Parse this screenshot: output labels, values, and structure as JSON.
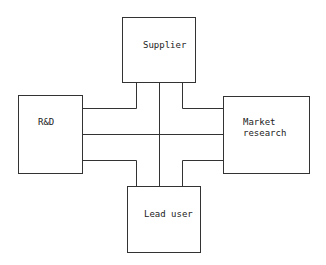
{
  "diagram": {
    "type": "block-diagram",
    "nodes": [
      {
        "id": "supplier",
        "label": "Supplier",
        "position": "top"
      },
      {
        "id": "rnd",
        "label": "R&D",
        "position": "left"
      },
      {
        "id": "market",
        "label": "Market\nresearch",
        "position": "right"
      },
      {
        "id": "lead",
        "label": "Lead user",
        "position": "bottom"
      }
    ],
    "connections": "cross-shaped channel with three parallel lines linking all four boxes",
    "colors": {
      "line": "#333333",
      "background": "#ffffff"
    }
  }
}
